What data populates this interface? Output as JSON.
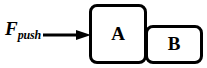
{
  "figure": {
    "type": "free-body-diagram",
    "canvas": {
      "width": 207,
      "height": 68,
      "background": "#ffffff"
    },
    "stroke_color": "#000000",
    "force": {
      "symbol": "F",
      "subscript": "push",
      "full_label": "Fpush",
      "arrow_direction": "right",
      "arrow_icon": "right-arrow-icon"
    },
    "blocks": [
      {
        "id": "a",
        "label": "A",
        "name": "block-a",
        "x": 89,
        "y": 4,
        "width": 58,
        "height": 60
      },
      {
        "id": "b",
        "label": "B",
        "name": "block-b",
        "x": 145,
        "y": 25,
        "width": 58,
        "height": 39
      }
    ]
  }
}
